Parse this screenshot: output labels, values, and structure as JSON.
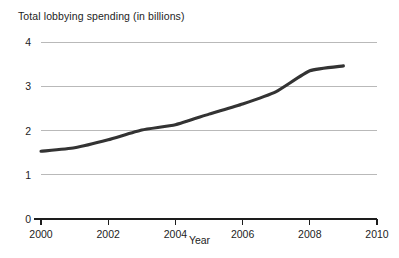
{
  "chart_data": {
    "type": "line",
    "title": "Total lobbying spending (in billions)",
    "xlabel": "Year",
    "ylabel": "",
    "x": [
      2000,
      2001,
      2002,
      2003,
      2004,
      2005,
      2006,
      2007,
      2008,
      2009
    ],
    "values": [
      1.53,
      1.61,
      1.79,
      2.01,
      2.13,
      2.37,
      2.6,
      2.88,
      3.35,
      3.46
    ],
    "series": [
      {
        "name": "Total lobbying spending",
        "values": [
          1.53,
          1.61,
          1.79,
          2.01,
          2.13,
          2.37,
          2.6,
          2.88,
          3.35,
          3.46
        ]
      }
    ],
    "xlim": [
      2000,
      2010
    ],
    "ylim": [
      0,
      4
    ],
    "xticks": [
      2000,
      2002,
      2004,
      2006,
      2008,
      2010
    ],
    "xtick_labels": [
      "2000",
      "2002",
      "2004",
      "2006",
      "2008",
      "2010"
    ],
    "yticks": [
      0,
      1,
      2,
      3,
      4
    ],
    "ytick_labels": [
      "0",
      "1",
      "2",
      "3",
      "4"
    ],
    "grid": "horizontal",
    "legend": "none",
    "line_color": "#333333",
    "grid_color": "#b9b9b9",
    "axis_color": "#1d1d1d"
  }
}
